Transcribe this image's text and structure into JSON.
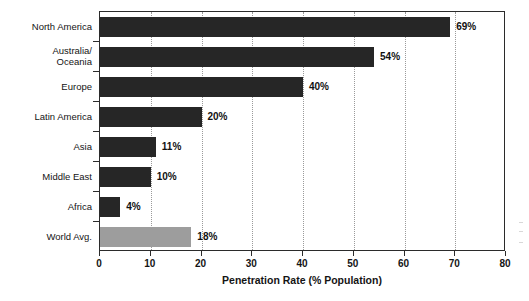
{
  "chart_data": {
    "type": "bar",
    "orientation": "horizontal",
    "title": "",
    "xlabel": "Penetration Rate (% Population)",
    "ylabel": "",
    "xlim": [
      0,
      80
    ],
    "xticks": [
      0,
      10,
      20,
      30,
      40,
      50,
      60,
      70,
      80
    ],
    "xtick_labels": [
      "0",
      "10",
      "20",
      "30",
      "40",
      "50",
      "60",
      "70",
      "80"
    ],
    "grid": "vertical-dotted",
    "legend": "none",
    "categories": [
      "North America",
      "Australia/\nOceania",
      "Europe",
      "Latin America",
      "Asia",
      "Middle East",
      "Africa",
      "World Avg."
    ],
    "values": [
      69,
      54,
      40,
      20,
      11,
      10,
      4,
      18
    ],
    "value_labels": [
      "69%",
      "54%",
      "40%",
      "20%",
      "11%",
      "10%",
      "4%",
      "18%"
    ],
    "bar_colors": [
      "#262626",
      "#262626",
      "#262626",
      "#262626",
      "#262626",
      "#262626",
      "#262626",
      "#9d9d9d"
    ],
    "colors": {
      "bar_dark": "#262626",
      "bar_highlight": "#9d9d9d",
      "axis": "#2b2b2b",
      "grid": "#9a9a9a",
      "text": "#141414",
      "background": "#ffffff"
    }
  }
}
